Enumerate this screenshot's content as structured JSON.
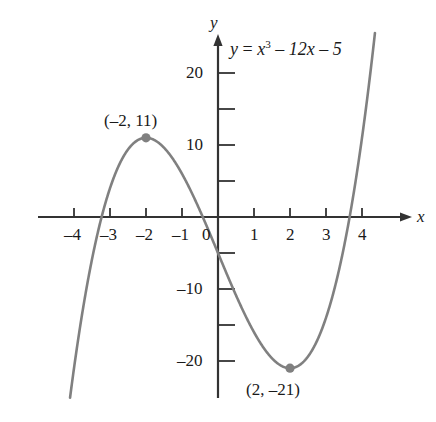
{
  "figure": {
    "title": "",
    "background_color": "#ffffff",
    "curve_color": "#808080",
    "axis_color": "#333333",
    "text_color": "#1a1a1a"
  },
  "equation": {
    "lhs": "y",
    "equals": "=",
    "term1_base": "x",
    "term1_exp": "3",
    "term2": "– 12x",
    "term3": "– 5",
    "full_text": "y = x³ – 12x – 5"
  },
  "axes": {
    "x_name": "x",
    "y_name": "y",
    "x_tick_labels": [
      "–4",
      "–3",
      "–2",
      "–1",
      "0",
      "1",
      "2",
      "3",
      "4"
    ],
    "x_tick_values": [
      -4,
      -3,
      -2,
      -1,
      0,
      1,
      2,
      3,
      4
    ],
    "y_tick_labels": [
      "20",
      "10",
      "–10",
      "–20"
    ],
    "y_tick_values": [
      20,
      10,
      -10,
      -20
    ],
    "y_minor_tick_values": [
      15,
      5,
      -5,
      -15
    ],
    "x_range": [
      -4.6,
      4.6
    ],
    "y_range": [
      -24,
      25
    ]
  },
  "points": [
    {
      "name": "local-maximum",
      "label": "(–2, 11)",
      "x": -2,
      "y": 11
    },
    {
      "name": "local-minimum",
      "label": "(2, –21)",
      "x": 2,
      "y": -21
    }
  ],
  "chart_data": {
    "type": "line",
    "title": "",
    "xlabel": "x",
    "ylabel": "y",
    "function": "y = x^3 - 12x - 5",
    "xlim": [
      -4.6,
      4.6
    ],
    "ylim": [
      -24,
      25
    ],
    "grid": false,
    "legend": "none",
    "annotations": [
      {
        "text": "y = x³ – 12x – 5",
        "x": 0.45,
        "y": 23
      },
      {
        "text": "(–2, 11)",
        "x": -2,
        "y": 15
      },
      {
        "text": "(2, –21)",
        "x": 2,
        "y": -25
      }
    ],
    "x": [
      -3.62,
      -3.5,
      -3.25,
      -3.0,
      -2.75,
      -2.5,
      -2.25,
      -2.0,
      -1.75,
      -1.5,
      -1.25,
      -1.0,
      -0.75,
      -0.5,
      -0.25,
      0,
      0.25,
      0.5,
      0.75,
      1.0,
      1.25,
      1.5,
      1.75,
      2.0,
      2.25,
      2.5,
      2.75,
      3.0,
      3.25,
      3.5,
      3.75,
      4.0,
      4.2
    ],
    "values": [
      -9.0,
      -5.88,
      0.33,
      4.0,
      7.2,
      9.38,
      10.61,
      11.0,
      10.64,
      9.63,
      8.05,
      6.0,
      3.58,
      0.88,
      -2.02,
      -5.0,
      -7.98,
      -10.88,
      -13.58,
      -16.0,
      -18.05,
      -19.63,
      -20.64,
      -21.0,
      -20.61,
      -19.38,
      -17.2,
      -14.0,
      -9.67,
      -4.13,
      2.72,
      11.0,
      19.67
    ],
    "key_points": [
      {
        "label": "local maximum",
        "x": -2,
        "y": 11
      },
      {
        "label": "local minimum",
        "x": 2,
        "y": -21
      }
    ]
  }
}
